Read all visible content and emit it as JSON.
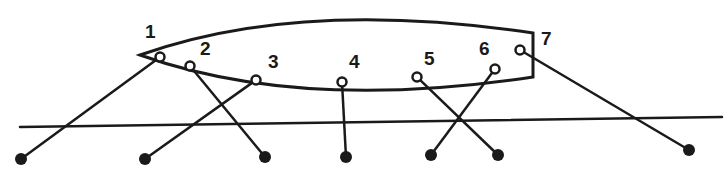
{
  "diagram": {
    "type": "mooring-lines",
    "colors": {
      "ink": "#1a1a1a",
      "background": "#ffffff"
    },
    "hull": {
      "bow_tip": [
        140,
        55
      ],
      "stern_top": [
        533,
        33
      ],
      "stern_bottom": [
        533,
        77
      ]
    },
    "quay_line": {
      "from": [
        20,
        127
      ],
      "to": [
        722,
        117
      ]
    },
    "lines": [
      {
        "label": "1",
        "fairlead": [
          160,
          57
        ],
        "bollard": [
          21,
          159
        ],
        "label_pos": [
          145,
          38
        ]
      },
      {
        "label": "2",
        "fairlead": [
          190,
          66
        ],
        "bollard": [
          265,
          157
        ],
        "label_pos": [
          200,
          55
        ]
      },
      {
        "label": "3",
        "fairlead": [
          256,
          80
        ],
        "bollard": [
          145,
          159
        ],
        "label_pos": [
          268,
          68
        ]
      },
      {
        "label": "4",
        "fairlead": [
          342,
          82
        ],
        "bollard": [
          346,
          157
        ],
        "label_pos": [
          349,
          68
        ]
      },
      {
        "label": "5",
        "fairlead": [
          417,
          77
        ],
        "bollard": [
          498,
          155
        ],
        "label_pos": [
          424,
          65
        ]
      },
      {
        "label": "6",
        "fairlead": [
          495,
          69
        ],
        "bollard": [
          431,
          155
        ],
        "label_pos": [
          479,
          55
        ]
      },
      {
        "label": "7",
        "fairlead": [
          520,
          50
        ],
        "bollard": [
          689,
          150
        ],
        "label_pos": [
          541,
          45
        ]
      }
    ]
  }
}
